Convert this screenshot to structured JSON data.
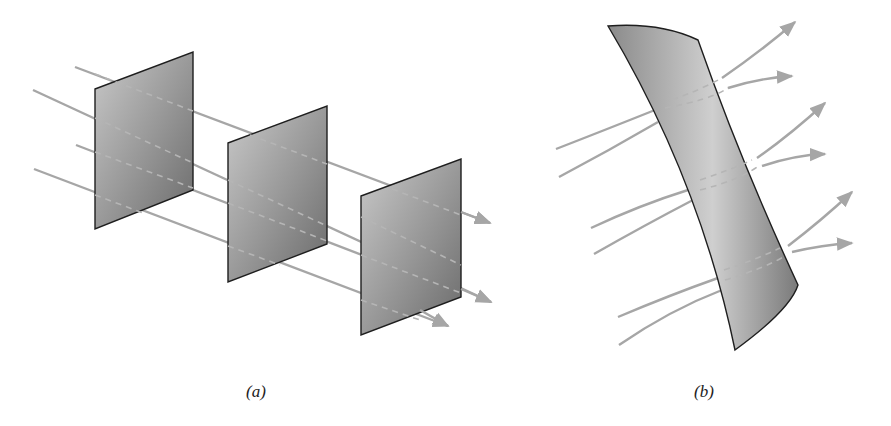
{
  "figure": {
    "panels": [
      {
        "id": "a",
        "caption": "(a)",
        "description": "Uniform field lines passing through three parallel flat surfaces",
        "surface_count": 3,
        "field_line_count": 4
      },
      {
        "id": "b",
        "caption": "(b)",
        "description": "Non-uniform curved field lines passing through a curved surface",
        "surface_count": 1,
        "field_line_count": 6
      }
    ],
    "colors": {
      "field_line": "#a6a6a6",
      "surface_dark": "#6f6f6f",
      "surface_light": "#c8c8c8",
      "edge": "#1e1e1e"
    }
  }
}
